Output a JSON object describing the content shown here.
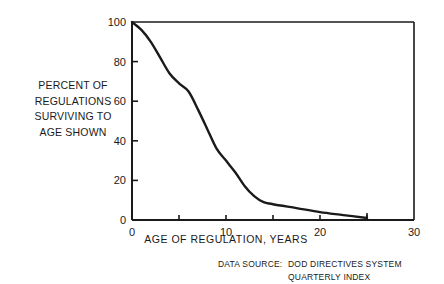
{
  "chart_data": {
    "type": "line",
    "title": "",
    "xlabel": "AGE OF REGULATION, YEARS",
    "ylabel": [
      "PERCENT OF",
      "REGULATIONS",
      "SURVIVING TO",
      "AGE SHOWN"
    ],
    "xlim": [
      0,
      30
    ],
    "ylim": [
      0,
      100
    ],
    "x_ticks": [
      0,
      10,
      20,
      30
    ],
    "x_minor_ticks": [
      5,
      15,
      25
    ],
    "y_ticks": [
      0,
      20,
      40,
      60,
      80,
      100
    ],
    "y_minor_ticks": [],
    "grid": false,
    "legend": null,
    "values_are_estimates": true,
    "estimate_note": "Curve points traced from the plotted line against axis ticks; approximately ±1-2 percentage points and ±0.2 years. No data values are labeled on the chart.",
    "series": [
      {
        "name": "Percent of regulations surviving",
        "x": [
          0,
          1,
          2,
          3,
          4,
          5,
          6,
          7,
          8,
          9,
          10,
          11,
          12,
          13,
          14,
          15,
          17.5,
          20,
          22.5,
          25
        ],
        "values": [
          100,
          96,
          90,
          82,
          74,
          69,
          65,
          56,
          46,
          36,
          30,
          24,
          17,
          12,
          9,
          8,
          6,
          4,
          2.5,
          1
        ]
      }
    ],
    "end_marker": {
      "x": 25,
      "y": 1,
      "style": "vertical-tick"
    },
    "annotations": {
      "data_source_label": "DATA SOURCE:",
      "data_source_lines": [
        "DOD DIRECTIVES SYSTEM",
        "QUARTERLY INDEX"
      ]
    }
  },
  "labels": {
    "y_axis_lines": [
      "PERCENT OF",
      "REGULATIONS",
      "SURVIVING TO",
      "AGE SHOWN"
    ],
    "x_axis": "AGE OF REGULATION, YEARS",
    "source_label": "DATA SOURCE:",
    "source_line_1": "DOD DIRECTIVES SYSTEM",
    "source_line_2": "QUARTERLY INDEX"
  },
  "colors": {
    "ink": "#1a1a1a",
    "background": "#ffffff"
  }
}
